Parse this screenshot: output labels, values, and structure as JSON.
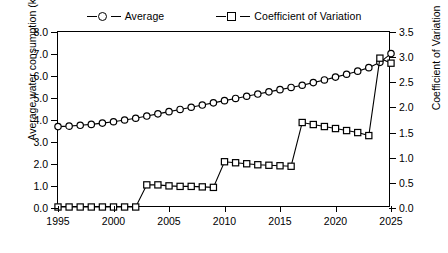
{
  "legend": {
    "entries": [
      {
        "label": "Average",
        "marker": "circle-marker"
      },
      {
        "label": "Coefficient of Variation",
        "marker": "square-marker"
      }
    ]
  },
  "axes": {
    "left_title": "Average water consumption (km³)",
    "right_title": "Coefficient of Variation",
    "x_title": "",
    "left_ticks": [
      "0.0",
      "1.0",
      "2.0",
      "3.0",
      "4.0",
      "5.0",
      "6.0",
      "7.0",
      "8.0"
    ],
    "right_ticks": [
      "0.0",
      "0.5",
      "1.0",
      "1.5",
      "2.0",
      "2.5",
      "3.0",
      "3.5"
    ],
    "x_ticks": [
      "1995",
      "2000",
      "2005",
      "2010",
      "2015",
      "2020",
      "2025"
    ]
  },
  "chart_data": {
    "type": "line",
    "title": "",
    "xlabel": "",
    "ylabel": "Average water consumption (km³)",
    "y2label": "Coefficient of Variation",
    "xlim": [
      1995,
      2025
    ],
    "ylim": [
      0.0,
      8.0
    ],
    "y2lim": [
      0.0,
      3.5
    ],
    "grid": false,
    "legend_position": "top-center",
    "x": [
      1995,
      1996,
      1997,
      1998,
      1999,
      2000,
      2001,
      2002,
      2003,
      2004,
      2005,
      2006,
      2007,
      2008,
      2009,
      2010,
      2011,
      2012,
      2013,
      2014,
      2015,
      2016,
      2017,
      2018,
      2019,
      2020,
      2021,
      2022,
      2023,
      2024,
      2025
    ],
    "series": [
      {
        "name": "Average",
        "axis": "left",
        "marker": "circle",
        "values": [
          3.7,
          3.72,
          3.76,
          3.8,
          3.86,
          3.92,
          4.0,
          4.08,
          4.18,
          4.28,
          4.38,
          4.48,
          4.58,
          4.68,
          4.78,
          4.88,
          4.98,
          5.08,
          5.18,
          5.28,
          5.38,
          5.48,
          5.58,
          5.7,
          5.82,
          5.95,
          6.08,
          6.22,
          6.38,
          6.62,
          7.02
        ]
      },
      {
        "name": "Coefficient of Variation",
        "axis": "right",
        "marker": "square",
        "values": [
          0.02,
          0.02,
          0.02,
          0.02,
          0.02,
          0.02,
          0.02,
          0.02,
          0.46,
          0.46,
          0.44,
          0.43,
          0.43,
          0.42,
          0.41,
          0.92,
          0.9,
          0.88,
          0.86,
          0.85,
          0.84,
          0.83,
          1.7,
          1.66,
          1.62,
          1.58,
          1.54,
          1.5,
          1.44,
          2.98,
          2.88
        ]
      }
    ]
  }
}
